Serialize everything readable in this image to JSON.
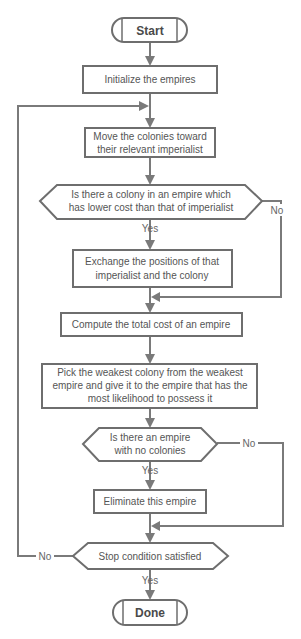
{
  "diagram": {
    "type": "flowchart",
    "stroke_color": "#6e6e6e",
    "text_color": "#555555",
    "nodes": [
      {
        "id": "start",
        "shape": "terminator",
        "label": "Start"
      },
      {
        "id": "init",
        "shape": "process",
        "label": "Initialize the empires"
      },
      {
        "id": "move",
        "shape": "process",
        "lines": [
          "Move the colonies toward",
          "their relevant imperialist"
        ]
      },
      {
        "id": "decision_lower_cost",
        "shape": "decision",
        "lines": [
          "Is there a colony in an empire which",
          "has lower cost than that of imperialist"
        ]
      },
      {
        "id": "exchange",
        "shape": "process",
        "lines": [
          "Exchange the positions of that",
          "imperialist and the colony"
        ]
      },
      {
        "id": "compute",
        "shape": "process",
        "label": "Compute the total cost of an empire"
      },
      {
        "id": "pick",
        "shape": "process",
        "lines": [
          "Pick the weakest colony from the weakest",
          "empire and give it to the empire that has the",
          "most likelihood to possess it"
        ]
      },
      {
        "id": "decision_no_colonies",
        "shape": "decision",
        "lines": [
          "Is there an empire",
          "with no colonies"
        ]
      },
      {
        "id": "eliminate",
        "shape": "process",
        "label": "Eliminate this empire"
      },
      {
        "id": "decision_stop",
        "shape": "decision",
        "label": "Stop condition satisfied"
      },
      {
        "id": "done",
        "shape": "terminator",
        "label": "Done"
      }
    ],
    "edges": [
      {
        "from": "start",
        "to": "init",
        "label": ""
      },
      {
        "from": "init",
        "to": "move",
        "label": ""
      },
      {
        "from": "move",
        "to": "decision_lower_cost",
        "label": ""
      },
      {
        "from": "decision_lower_cost",
        "to": "exchange",
        "label": "Yes"
      },
      {
        "from": "decision_lower_cost",
        "to": "compute",
        "label": "No"
      },
      {
        "from": "exchange",
        "to": "compute",
        "label": ""
      },
      {
        "from": "compute",
        "to": "pick",
        "label": ""
      },
      {
        "from": "pick",
        "to": "decision_no_colonies",
        "label": ""
      },
      {
        "from": "decision_no_colonies",
        "to": "eliminate",
        "label": "Yes"
      },
      {
        "from": "decision_no_colonies",
        "to": "decision_stop",
        "label": "No"
      },
      {
        "from": "eliminate",
        "to": "decision_stop",
        "label": ""
      },
      {
        "from": "decision_stop",
        "to": "done",
        "label": "Yes"
      },
      {
        "from": "decision_stop",
        "to": "move",
        "label": "No"
      }
    ],
    "edge_labels": {
      "yes": "Yes",
      "no": "No"
    }
  }
}
